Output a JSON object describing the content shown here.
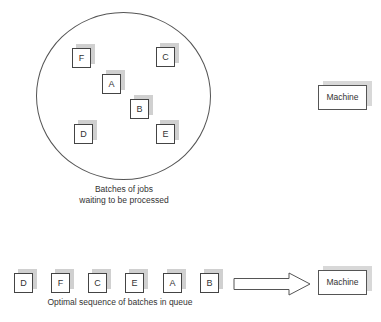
{
  "pool": {
    "caption_line1": "Batches of jobs",
    "caption_line2": "waiting to be processed",
    "jobs": [
      {
        "label": "F"
      },
      {
        "label": "C"
      },
      {
        "label": "A"
      },
      {
        "label": "B"
      },
      {
        "label": "D"
      },
      {
        "label": "E"
      }
    ]
  },
  "machine_top": {
    "label": "Machine"
  },
  "queue": {
    "caption": "Optimal sequence of batches in queue",
    "jobs": [
      {
        "label": "D"
      },
      {
        "label": "F"
      },
      {
        "label": "C"
      },
      {
        "label": "E"
      },
      {
        "label": "A"
      },
      {
        "label": "B"
      }
    ]
  },
  "machine_bottom": {
    "label": "Machine"
  },
  "colors": {
    "line": "#444444",
    "shadow": "#d0d0d0",
    "background": "#ffffff"
  }
}
